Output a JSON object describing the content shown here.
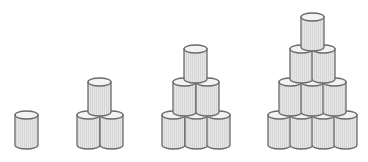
{
  "figure": {
    "colors": {
      "outline": "#6a6a6a",
      "body": "#e6e6e6",
      "stripe": "#d2d2d2",
      "top": "#f3f3f3"
    },
    "can": {
      "width": 23,
      "height": 38,
      "ellipse_ry": 4
    },
    "groups": [
      {
        "name": "group-1",
        "count": 1,
        "cans": [
          [
            15,
            111
          ]
        ]
      },
      {
        "name": "group-2",
        "count": 3,
        "cans": [
          [
            77,
            111
          ],
          [
            100,
            111
          ],
          [
            88,
            78
          ]
        ]
      },
      {
        "name": "group-3",
        "count": 6,
        "cans": [
          [
            162,
            111
          ],
          [
            185,
            111
          ],
          [
            207,
            111
          ],
          [
            173,
            78
          ],
          [
            196,
            78
          ],
          [
            184,
            45
          ]
        ]
      },
      {
        "name": "group-4",
        "count": 10,
        "cans": [
          [
            268,
            111
          ],
          [
            290,
            111
          ],
          [
            312,
            111
          ],
          [
            334,
            111
          ],
          [
            279,
            78
          ],
          [
            301,
            78
          ],
          [
            323,
            78
          ],
          [
            290,
            45
          ],
          [
            312,
            45
          ],
          [
            301,
            13
          ]
        ]
      }
    ]
  }
}
